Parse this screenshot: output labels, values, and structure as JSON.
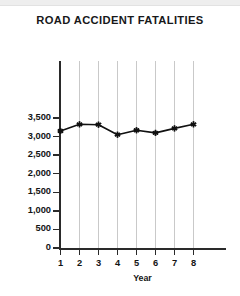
{
  "chart_data": {
    "type": "line",
    "title": "ROAD ACCIDENT FATALITIES",
    "xlabel": "Year",
    "ylabel": "",
    "categories": [
      "1",
      "2",
      "3",
      "4",
      "5",
      "6",
      "7",
      "8"
    ],
    "values": [
      3150,
      3330,
      3320,
      3050,
      3170,
      3100,
      3220,
      3330
    ],
    "ylim": [
      0,
      3500
    ],
    "ytick_values": [
      0,
      500,
      1000,
      1500,
      2000,
      2500,
      3000,
      3500
    ],
    "ytick_labels": [
      "0",
      "500",
      "1,000",
      "1,500",
      "2,000",
      "2,500",
      "3,000",
      "3,500"
    ],
    "xtick_labels": [
      "1",
      "2",
      "3",
      "4",
      "5",
      "6",
      "7",
      "8"
    ],
    "grid": "vertical",
    "legend": "none",
    "series": [
      {
        "name": "Fatalities",
        "values": [
          3150,
          3330,
          3320,
          3050,
          3170,
          3100,
          3220,
          3330
        ],
        "line_color": "#111111",
        "marker": "star"
      }
    ],
    "colors": {
      "line": "#111111",
      "marker": "#111111",
      "axis": "#2a2a2a",
      "gridline": "#c9c9c9",
      "text": "#141414",
      "background": "#ffffff"
    }
  }
}
